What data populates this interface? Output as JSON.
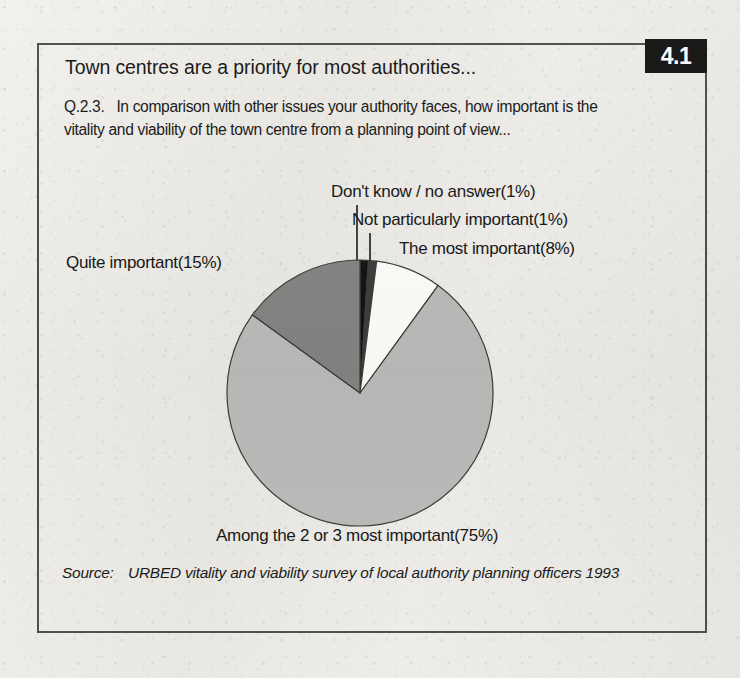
{
  "figure": {
    "number": "4.1",
    "title": "Town centres are a priority for most authorities...",
    "question_number": "Q.2.3.",
    "question_text": "In comparison with other issues your authority faces, how important is the vitality and viability of the town centre from a planning point of view...",
    "source_label": "Source:",
    "source_text": "URBED vitality and viability survey of local authority planning officers 1993"
  },
  "labels": {
    "dont_know": "Don't know / no answer(1%)",
    "not_particularly": "Not particularly important(1%)",
    "most_important": "The most important(8%)",
    "quite_important": "Quite important(15%)",
    "among_2_or_3": "Among the 2 or 3 most important(75%)"
  },
  "colors": {
    "slice_dont_know": "#121212",
    "slice_not_particularly": "#3c3c3c",
    "slice_most_important": "#fbfbf8",
    "slice_among": "#b9b9b7",
    "slice_quite": "#828281",
    "outline": "#3a3a38",
    "badge_bg": "#100f0e",
    "badge_fg": "#fdfdfc",
    "border": "#4a4a48",
    "paper": "#eeece7"
  },
  "chart_data": {
    "type": "pie",
    "title": "Town centres are a priority for most authorities...",
    "subtitle": "Q.2.3. In comparison with other issues your authority faces, how important is the vitality and viability of the town centre from a planning point of view...",
    "unit": "%",
    "total": 100,
    "start_angle_deg": 0,
    "direction": "clockwise",
    "legend": "none (direct labels with leader lines)",
    "grid": false,
    "categories": [
      "Don't know / no answer",
      "Not particularly important",
      "The most important",
      "Among the 2 or 3 most important",
      "Quite important"
    ],
    "values": [
      1,
      1,
      8,
      75,
      15
    ],
    "slices": [
      {
        "label": "Don't know / no answer",
        "value": 1,
        "display": "1%",
        "color": "#121212"
      },
      {
        "label": "Not particularly important",
        "value": 1,
        "display": "1%",
        "color": "#3c3c3c"
      },
      {
        "label": "The most important",
        "value": 8,
        "display": "8%",
        "color": "#fbfbf8"
      },
      {
        "label": "Among the 2 or 3 most important",
        "value": 75,
        "display": "75%",
        "color": "#b9b9b7"
      },
      {
        "label": "Quite important",
        "value": 15,
        "display": "15%",
        "color": "#828281"
      }
    ],
    "source": "URBED vitality and viability survey of local authority planning officers 1993"
  }
}
